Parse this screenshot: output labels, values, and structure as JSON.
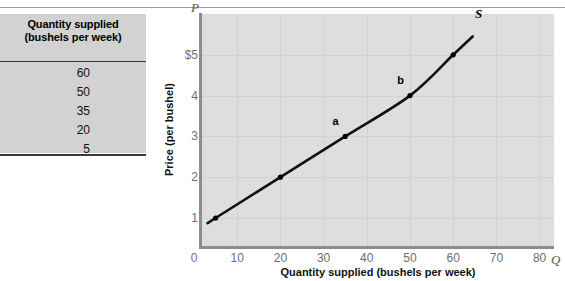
{
  "table": {
    "header_line1": "Quantity supplied",
    "header_line2": "(bushels per week)",
    "values": [
      "60",
      "50",
      "35",
      "20",
      "5"
    ]
  },
  "chart_data": {
    "type": "line",
    "title": "",
    "xlabel": "Quantity supplied (bushels per week)",
    "ylabel": "Price (per bushel)",
    "xlim": [
      0,
      85
    ],
    "ylim": [
      0,
      6.1
    ],
    "xticks": [
      "0",
      "10",
      "20",
      "30",
      "40",
      "50",
      "60",
      "70",
      "80"
    ],
    "xtick_values": [
      0,
      10,
      20,
      30,
      40,
      50,
      60,
      70,
      80
    ],
    "yticks": [
      "$5",
      "4",
      "3",
      "2",
      "1"
    ],
    "ytick_values": [
      5,
      4,
      3,
      2,
      1
    ],
    "x_axis_letter": "Q",
    "y_axis_letter": "P",
    "grid": true,
    "legend_position": "none",
    "series": [
      {
        "name": "S",
        "label": "S",
        "x": [
          5,
          20,
          35,
          50,
          60
        ],
        "values": [
          1,
          2,
          3,
          4,
          5
        ],
        "color": "#000000"
      }
    ],
    "points": [
      {
        "label": "",
        "x": 5,
        "y": 1
      },
      {
        "label": "",
        "x": 20,
        "y": 2
      },
      {
        "label": "a",
        "x": 35,
        "y": 3
      },
      {
        "label": "b",
        "x": 50,
        "y": 4
      },
      {
        "label": "",
        "x": 60,
        "y": 5
      }
    ],
    "annotations": [
      {
        "text": "a",
        "x": 33,
        "y": 3.3
      },
      {
        "text": "b",
        "x": 48,
        "y": 4.3
      },
      {
        "text": "S",
        "x": 66,
        "y": 5.95
      }
    ]
  }
}
